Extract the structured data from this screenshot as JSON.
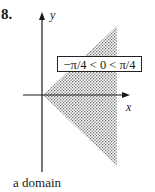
{
  "figure": {
    "number": "8.",
    "caption": "a domain",
    "region_label": "−π/4 < 0 < π/4",
    "axes": {
      "x_label": "x",
      "y_label": "y"
    },
    "region": {
      "shape": "wedge",
      "description": "shaded wedge with apex at origin opening to the right between the lines of angle −π/4 and π/4",
      "fill": "stippled gray"
    },
    "colors": {
      "ink": "#1a1a1a",
      "stipple": "#6b6b6b",
      "background": "#ffffff"
    }
  }
}
